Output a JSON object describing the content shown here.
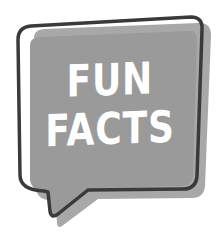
{
  "graphic": {
    "type": "speech-bubble",
    "lines": [
      "FUN",
      "FACTS"
    ],
    "colors": {
      "background": "#ffffff",
      "fill": "#9a9a9a",
      "shadow": "#a6a6a6",
      "outline": "#3a3a3a",
      "text": "#ffffff"
    }
  }
}
